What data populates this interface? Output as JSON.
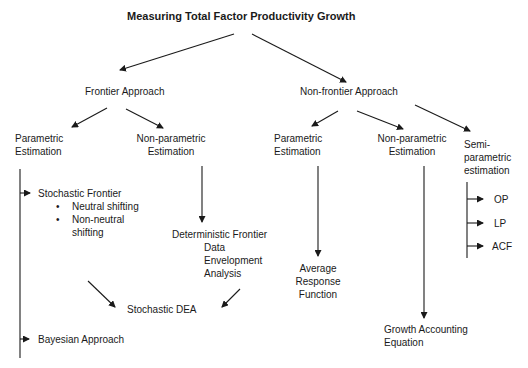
{
  "title": "Measuring Total Factor Productivity Growth",
  "frontier": {
    "label": "Frontier Approach",
    "parametric": {
      "line1": "Parametric",
      "line2": "Estimation"
    },
    "nonparametric": {
      "line1": "Non-parametric",
      "line2": "Estimation"
    },
    "stochastic_frontier": {
      "label": "Stochastic Frontier",
      "bullets": [
        "Neutral shifting",
        "Non-neutral",
        "shifting"
      ]
    },
    "deterministic": {
      "line1": "Deterministic Frontier",
      "line2": "Data",
      "line3": "Envelopment",
      "line4": "Analysis"
    },
    "stochastic_dea": "Stochastic DEA",
    "bayesian": "Bayesian Approach"
  },
  "nonfrontier": {
    "label": "Non-frontier Approach",
    "parametric": {
      "line1": "Parametric",
      "line2": "Estimation"
    },
    "nonparametric": {
      "line1": "Non-parametric",
      "line2": "Estimation"
    },
    "semiparametric": {
      "line1": "Semi-",
      "line2": "parametric",
      "line3": "estimation"
    },
    "average_response": {
      "line1": "Average",
      "line2": "Response",
      "line3": "Function"
    },
    "growth_accounting": {
      "line1": "Growth Accounting",
      "line2": "Equation"
    },
    "semi_methods": [
      "OP",
      "LP",
      "ACF"
    ]
  },
  "bullet_glyph": "•"
}
